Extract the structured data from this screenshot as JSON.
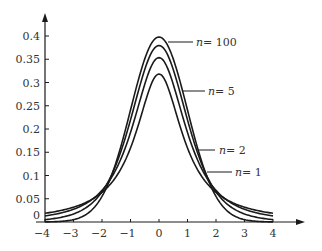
{
  "chart_data": {
    "type": "line",
    "title": "",
    "xlabel": "",
    "ylabel": "",
    "xlim": [
      -4,
      4
    ],
    "ylim": [
      0,
      0.4
    ],
    "grid": false,
    "legend": "inline labels with leader lines",
    "x_ticks": [
      -4,
      -3,
      -2,
      -1,
      0,
      1,
      2,
      3,
      4
    ],
    "x_tick_labels": [
      "−4",
      "−3",
      "−2",
      "−1",
      "0",
      "1",
      "2",
      "3",
      "4"
    ],
    "y_ticks": [
      0,
      0.05,
      0.1,
      0.15,
      0.2,
      0.25,
      0.3,
      0.35,
      0.4
    ],
    "y_tick_labels": [
      "0",
      "0.05",
      "0.1",
      "0.15",
      "0.2",
      "0.25",
      "0.3",
      "0.35",
      "0.4"
    ],
    "x": [
      -4,
      -3,
      -2,
      -1,
      0,
      1,
      2,
      3,
      4
    ],
    "series": [
      {
        "name": "n=100",
        "df": 100,
        "values": [
          0.0001,
          0.0045,
          0.0549,
          0.241,
          0.3979,
          0.241,
          0.0549,
          0.0045,
          0.0001
        ]
      },
      {
        "name": "n=5",
        "df": 5,
        "values": [
          0.0051,
          0.0173,
          0.0651,
          0.2197,
          0.3796,
          0.2197,
          0.0651,
          0.0173,
          0.0051
        ]
      },
      {
        "name": "n=2",
        "df": 2,
        "values": [
          0.0131,
          0.0274,
          0.068,
          0.1925,
          0.3536,
          0.1925,
          0.068,
          0.0274,
          0.0131
        ]
      },
      {
        "name": "n=1",
        "df": 1,
        "values": [
          0.0187,
          0.0318,
          0.0637,
          0.1592,
          0.3183,
          0.1592,
          0.0637,
          0.0318,
          0.0187
        ]
      }
    ],
    "annotations": [
      {
        "text": "n=100",
        "target": "n=100"
      },
      {
        "text": "n=5",
        "target": "n=5"
      },
      {
        "text": "n=2",
        "target": "n=2"
      },
      {
        "text": "n=1",
        "target": "n=1"
      }
    ]
  },
  "labels": {
    "n100": {
      "var": "n",
      "eq": "= 100"
    },
    "n5": {
      "var": "n",
      "eq": "= 5"
    },
    "n2": {
      "var": "n",
      "eq": "= 2"
    },
    "n1": {
      "var": "n",
      "eq": "= 1"
    }
  }
}
